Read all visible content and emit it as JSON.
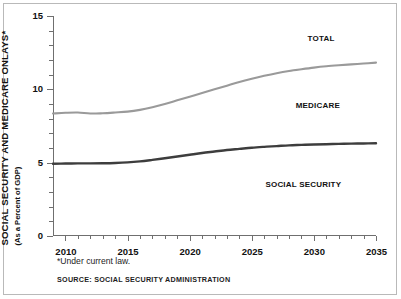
{
  "chart_data": {
    "type": "line",
    "title": "",
    "ylabel": "SOCIAL SECURITY AND MEDICARE ONLAYS*",
    "ylabel_sub": "(As a Percent of GDP)",
    "xlabel": "",
    "xlim": [
      2009,
      2035
    ],
    "ylim": [
      0,
      15
    ],
    "yticks": [
      0,
      5,
      10,
      15
    ],
    "ytick_labels": [
      "0",
      "5",
      "10",
      "15"
    ],
    "yminor_step": 1,
    "xticks": [
      2010,
      2015,
      2020,
      2025,
      2030,
      2035
    ],
    "xtick_labels": [
      "2010",
      "2015",
      "2020",
      "2025",
      "2030",
      "2035"
    ],
    "grid": false,
    "legend_position": "inline-annotations",
    "x": [
      2009,
      2010,
      2011,
      2012,
      2013,
      2014,
      2015,
      2016,
      2017,
      2018,
      2019,
      2020,
      2021,
      2022,
      2023,
      2024,
      2025,
      2026,
      2027,
      2028,
      2029,
      2030,
      2031,
      2032,
      2033,
      2034,
      2035
    ],
    "series": [
      {
        "name": "TOTAL",
        "color": "#9a9a9a",
        "width": 2.1,
        "values": [
          8.35,
          8.4,
          8.42,
          8.35,
          8.37,
          8.42,
          8.48,
          8.6,
          8.78,
          9.0,
          9.25,
          9.5,
          9.75,
          10.0,
          10.25,
          10.5,
          10.72,
          10.92,
          11.1,
          11.25,
          11.37,
          11.48,
          11.57,
          11.64,
          11.7,
          11.76,
          11.82
        ],
        "label_text": "TOTAL",
        "label_x_pct": 83.0,
        "label_y_pct": 10.0
      },
      {
        "name": "SOCIAL SECURITY",
        "color": "#3d3d3d",
        "width": 2.4,
        "values": [
          4.93,
          4.94,
          4.95,
          4.95,
          4.96,
          4.98,
          5.02,
          5.09,
          5.19,
          5.3,
          5.42,
          5.54,
          5.66,
          5.76,
          5.86,
          5.94,
          6.02,
          6.08,
          6.13,
          6.18,
          6.21,
          6.24,
          6.26,
          6.28,
          6.3,
          6.31,
          6.32
        ],
        "label_text": "SOCIAL SECURITY",
        "label_x_pct": 77.5,
        "label_y_pct": 76.5
      }
    ],
    "annotations": [
      {
        "name": "MEDICARE",
        "text": "MEDICARE",
        "label_x_pct": 82.0,
        "label_y_pct": 40.5
      }
    ]
  },
  "footnote": "*Under current law.",
  "source": "SOURCE: SOCIAL SECURITY ADMINISTRATION"
}
